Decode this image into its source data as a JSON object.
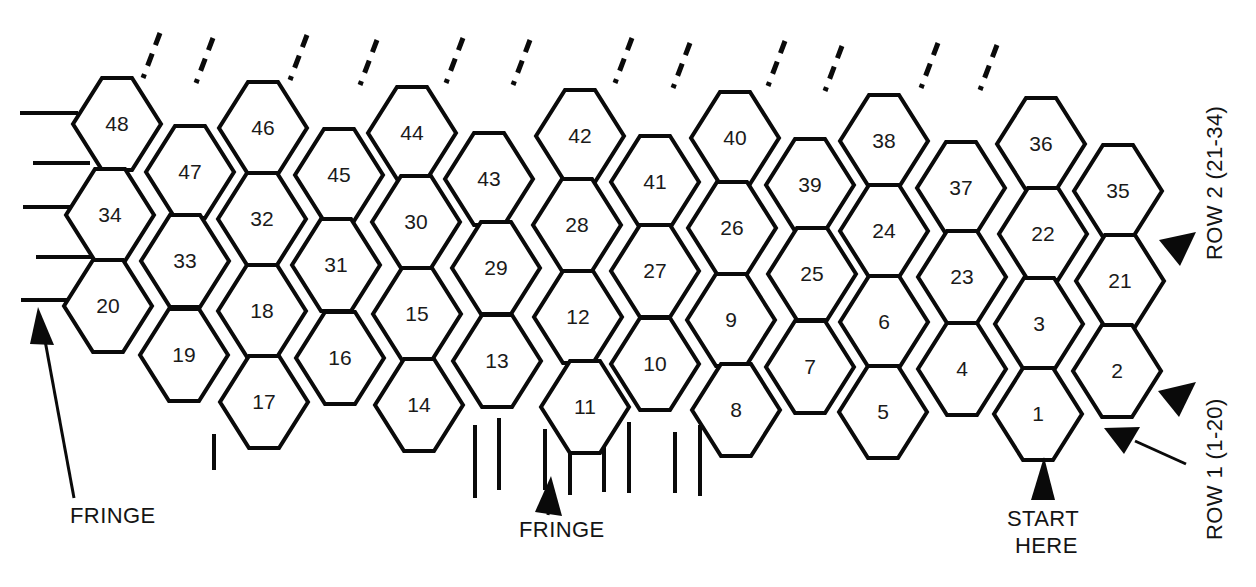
{
  "figure": {
    "type": "hexagon-bead-chart",
    "background_color": "#ffffff",
    "line_color": "#0a0a0a",
    "text_color": "#141414"
  },
  "grid": {
    "description": "Staggered honeycomb of flat-top hexagons numbered 1-48, numbered right-to-left in diagonal bands.",
    "origin_x": 1118,
    "origin_y": 414,
    "col_pitch": -82.5,
    "row_pitch": -46.0,
    "stagger_y": -23.0,
    "hex_width": 88,
    "hex_height": 92,
    "hex_side_flat": 30,
    "cells": [
      {
        "label": "48",
        "cx": 117,
        "cy": 124
      },
      {
        "label": "46",
        "cx": 263,
        "cy": 128
      },
      {
        "label": "44",
        "cx": 412,
        "cy": 133
      },
      {
        "label": "42",
        "cx": 580,
        "cy": 136
      },
      {
        "label": "40",
        "cx": 735,
        "cy": 138
      },
      {
        "label": "38",
        "cx": 884,
        "cy": 141
      },
      {
        "label": "36",
        "cx": 1041,
        "cy": 144
      },
      {
        "label": "47",
        "cx": 190,
        "cy": 172
      },
      {
        "label": "45",
        "cx": 339,
        "cy": 175
      },
      {
        "label": "43",
        "cx": 489,
        "cy": 179
      },
      {
        "label": "41",
        "cx": 655,
        "cy": 182
      },
      {
        "label": "39",
        "cx": 810,
        "cy": 185
      },
      {
        "label": "37",
        "cx": 961,
        "cy": 188
      },
      {
        "label": "35",
        "cx": 1118,
        "cy": 191
      },
      {
        "label": "34",
        "cx": 110,
        "cy": 215
      },
      {
        "label": "32",
        "cx": 262,
        "cy": 219
      },
      {
        "label": "30",
        "cx": 416,
        "cy": 222
      },
      {
        "label": "28",
        "cx": 577,
        "cy": 225
      },
      {
        "label": "26",
        "cx": 732,
        "cy": 228
      },
      {
        "label": "24",
        "cx": 884,
        "cy": 231
      },
      {
        "label": "22",
        "cx": 1043,
        "cy": 234
      },
      {
        "label": "33",
        "cx": 185,
        "cy": 261
      },
      {
        "label": "31",
        "cx": 336,
        "cy": 265
      },
      {
        "label": "29",
        "cx": 496,
        "cy": 268
      },
      {
        "label": "27",
        "cx": 655,
        "cy": 271
      },
      {
        "label": "25",
        "cx": 812,
        "cy": 274
      },
      {
        "label": "23",
        "cx": 962,
        "cy": 277
      },
      {
        "label": "21",
        "cx": 1120,
        "cy": 281
      },
      {
        "label": "20",
        "cx": 108,
        "cy": 306
      },
      {
        "label": "18",
        "cx": 262,
        "cy": 311
      },
      {
        "label": "15",
        "cx": 417,
        "cy": 314
      },
      {
        "label": "12",
        "cx": 578,
        "cy": 317
      },
      {
        "label": "9",
        "cx": 731,
        "cy": 320
      },
      {
        "label": "6",
        "cx": 884,
        "cy": 322
      },
      {
        "label": "3",
        "cx": 1039,
        "cy": 324
      },
      {
        "label": "19",
        "cx": 184,
        "cy": 355
      },
      {
        "label": "16",
        "cx": 340,
        "cy": 358
      },
      {
        "label": "13",
        "cx": 497,
        "cy": 361
      },
      {
        "label": "10",
        "cx": 655,
        "cy": 364
      },
      {
        "label": "7",
        "cx": 810,
        "cy": 367
      },
      {
        "label": "4",
        "cx": 962,
        "cy": 369
      },
      {
        "label": "2",
        "cx": 1117,
        "cy": 371
      },
      {
        "label": "17",
        "cx": 264,
        "cy": 402
      },
      {
        "label": "14",
        "cx": 419,
        "cy": 405
      },
      {
        "label": "11",
        "cx": 585,
        "cy": 407
      },
      {
        "label": "8",
        "cx": 736,
        "cy": 410
      },
      {
        "label": "5",
        "cx": 883,
        "cy": 412
      },
      {
        "label": "1",
        "cx": 1038,
        "cy": 414
      }
    ]
  },
  "fringe": {
    "left_lines": [
      {
        "x1": 20,
        "y1": 113,
        "x2": 78,
        "y2": 113
      },
      {
        "x1": 33,
        "y1": 163,
        "x2": 90,
        "y2": 163
      },
      {
        "x1": 23,
        "y1": 207,
        "x2": 80,
        "y2": 207
      },
      {
        "x1": 36,
        "y1": 257,
        "x2": 93,
        "y2": 257
      },
      {
        "x1": 21,
        "y1": 300,
        "x2": 78,
        "y2": 300
      }
    ],
    "top_dashes": [
      {
        "x1": 160,
        "y1": 33,
        "x2": 143,
        "y2": 78
      },
      {
        "x1": 213,
        "y1": 38,
        "x2": 196,
        "y2": 83
      },
      {
        "x1": 307,
        "y1": 35,
        "x2": 290,
        "y2": 80
      },
      {
        "x1": 377,
        "y1": 40,
        "x2": 360,
        "y2": 85
      },
      {
        "x1": 463,
        "y1": 38,
        "x2": 446,
        "y2": 83
      },
      {
        "x1": 530,
        "y1": 40,
        "x2": 513,
        "y2": 85
      },
      {
        "x1": 632,
        "y1": 38,
        "x2": 615,
        "y2": 83
      },
      {
        "x1": 690,
        "y1": 43,
        "x2": 673,
        "y2": 88
      },
      {
        "x1": 785,
        "y1": 41,
        "x2": 768,
        "y2": 86
      },
      {
        "x1": 842,
        "y1": 46,
        "x2": 825,
        "y2": 91
      },
      {
        "x1": 938,
        "y1": 43,
        "x2": 921,
        "y2": 88
      },
      {
        "x1": 997,
        "y1": 45,
        "x2": 980,
        "y2": 90
      }
    ],
    "bottom_lines": [
      {
        "x1": 475,
        "y1": 425,
        "x2": 475,
        "y2": 498
      },
      {
        "x1": 499,
        "y1": 418,
        "x2": 499,
        "y2": 490
      },
      {
        "x1": 545,
        "y1": 429,
        "x2": 545,
        "y2": 490
      },
      {
        "x1": 570,
        "y1": 422,
        "x2": 570,
        "y2": 495
      },
      {
        "x1": 604,
        "y1": 430,
        "x2": 604,
        "y2": 492
      },
      {
        "x1": 629,
        "y1": 422,
        "x2": 629,
        "y2": 493
      },
      {
        "x1": 675,
        "y1": 432,
        "x2": 675,
        "y2": 493
      },
      {
        "x1": 700,
        "y1": 425,
        "x2": 700,
        "y2": 496
      },
      {
        "x1": 214,
        "y1": 434,
        "x2": 214,
        "y2": 470
      }
    ]
  },
  "annotations": [
    {
      "id": "fringe-left",
      "label": "FRINGE",
      "text_x": 70,
      "text_y": 523,
      "rotation": 0
    },
    {
      "id": "fringe-bottom",
      "label": "FRINGE",
      "text_x": 519,
      "text_y": 537,
      "rotation": 0
    },
    {
      "id": "start-here",
      "label_line1": "START",
      "label_line2": "HERE",
      "text_x": 1007,
      "text_y": 526,
      "rotation": 0
    },
    {
      "id": "row-2",
      "label": "ROW 2 (21-34)",
      "text_x": 1222,
      "text_y": 260,
      "rotation": -90
    },
    {
      "id": "row-1",
      "label": "ROW 1 (1-20)",
      "text_x": 1222,
      "text_y": 540,
      "rotation": -90
    }
  ]
}
